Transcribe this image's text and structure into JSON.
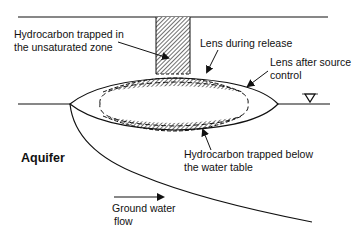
{
  "diagram": {
    "colors": {
      "line": "#111111",
      "background": "#ffffff",
      "hatch": "#222222"
    },
    "labels": {
      "unsaturated": {
        "line1": "Hydrocarbon trapped in",
        "line2": "the unsaturated zone"
      },
      "lens_release": "Lens during release",
      "lens_after": {
        "line1": "Lens after source",
        "line2": "control"
      },
      "below_table": {
        "line1": "Hydrocarbon trapped below",
        "line2": "the water table"
      },
      "aquifer": "Aquifer",
      "flow": {
        "line1": "Ground water",
        "line2": "flow"
      }
    },
    "symbols": {
      "water_table": "water-table-triangle"
    }
  }
}
